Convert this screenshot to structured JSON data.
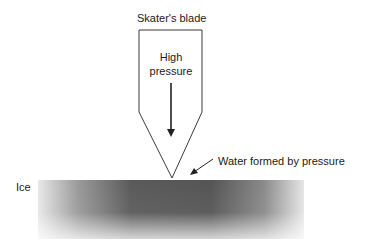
{
  "diagram": {
    "labels": {
      "blade": "Skater's blade",
      "pressure_line1": "High",
      "pressure_line2": "pressure",
      "water": "Water formed by pressure",
      "ice": "Ice"
    },
    "colors": {
      "outline": "#3a3a3a",
      "ice_dark": "#4a4a4a",
      "ice_light": "#e6e6e6"
    }
  }
}
